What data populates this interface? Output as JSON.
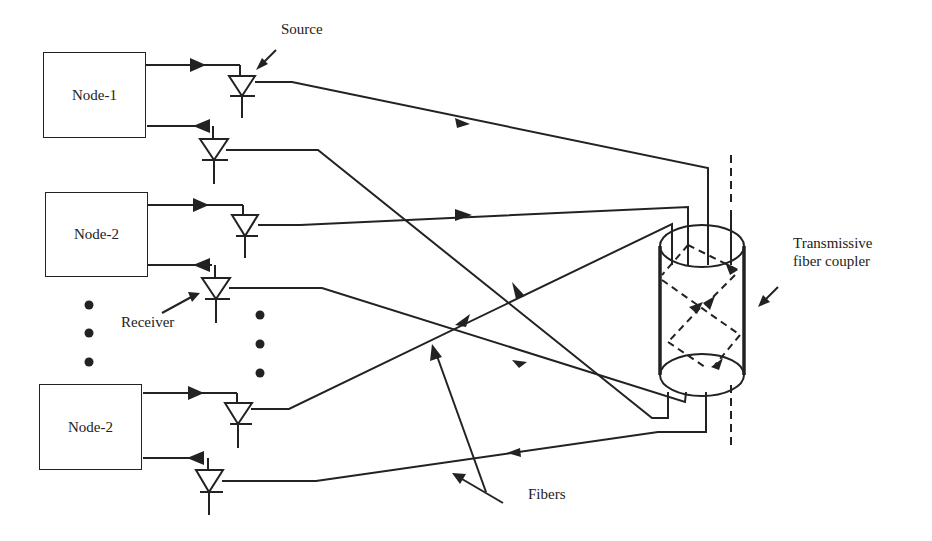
{
  "diagram": {
    "nodes": [
      {
        "label": "Node-1"
      },
      {
        "label": "Node-2"
      },
      {
        "label": "Node-2"
      }
    ],
    "labels": {
      "source": "Source",
      "receiver": "Receiver",
      "coupler_line1": "Transmissive",
      "coupler_line2": "fiber coupler",
      "fibers": "Fibers"
    },
    "ellipsis": "• • •",
    "colors": {
      "line": "#222222",
      "background": "#ffffff"
    }
  }
}
